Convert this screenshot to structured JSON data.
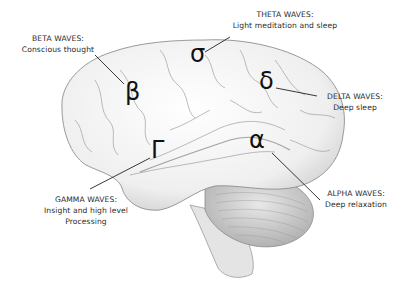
{
  "diagram": {
    "waves": [
      {
        "key": "beta",
        "symbol": "β",
        "name": "BETA WAVES:",
        "description": "Conscious thought"
      },
      {
        "key": "theta",
        "symbol": "σ",
        "name": "THETA WAVES:",
        "description": "Light meditation and sleep"
      },
      {
        "key": "delta",
        "symbol": "δ",
        "name": "DELTA WAVES:",
        "description": "Deep sleep"
      },
      {
        "key": "gamma",
        "symbol": "Γ",
        "name": "GAMMA WAVES:",
        "description": "Insight and high level",
        "description2": "Processing"
      },
      {
        "key": "alpha",
        "symbol": "α",
        "name": "ALPHA WAVES:",
        "description": "Deep relaxation"
      }
    ],
    "colors": {
      "background": "#ffffff",
      "text": "#2a2a2a",
      "symbol": "#111111",
      "leader_line": "#222222",
      "brain_fill": "#f4f4f4",
      "brain_shade": "#bdbdbd"
    }
  }
}
